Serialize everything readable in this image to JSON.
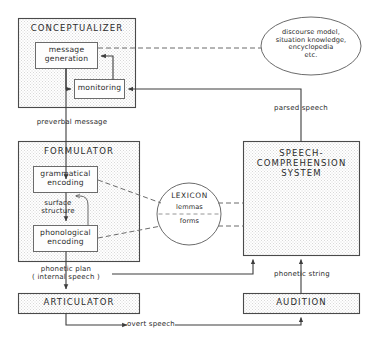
{
  "diagram": {
    "colors": {
      "stroke": "#4a4a4a",
      "inner_stroke": "#6b6b6b",
      "module_fill": "#f2f2f2",
      "inner_fill": "#fdfdfd",
      "text": "#2b2b2b",
      "background": "#ffffff"
    },
    "modules": [
      {
        "id": "conceptualizer",
        "label": "CONCEPTUALIZER"
      },
      {
        "id": "formulator",
        "label": "FORMULATOR"
      },
      {
        "id": "speech-comprehension-system",
        "label": "SPEECH-\nCOMPREHENSION\nSYSTEM"
      },
      {
        "id": "articulator",
        "label": "ARTICULATOR"
      },
      {
        "id": "audition",
        "label": "AUDITION"
      }
    ],
    "sub_processes": [
      {
        "id": "message-generation",
        "label": "message\ngeneration"
      },
      {
        "id": "monitoring",
        "label": "monitoring"
      },
      {
        "id": "grammatical-encoding",
        "label": "grammatical\nencoding"
      },
      {
        "id": "phonological-encoding",
        "label": "phonological\nencoding"
      }
    ],
    "knowledge_stores": [
      {
        "id": "discourse-knowledge",
        "label": "discourse model,\nsituation knowledge,\nencyclopedia\netc."
      },
      {
        "id": "lexicon",
        "title": "LEXICON",
        "upper": "lemmas",
        "lower": "forms"
      }
    ],
    "edge_labels": [
      {
        "id": "preverbal-message",
        "label": "preverbal message"
      },
      {
        "id": "surface-structure",
        "label": "surface\nstructure"
      },
      {
        "id": "phonetic-plan",
        "label": "phonetic plan\n( internal speech )"
      },
      {
        "id": "parsed-speech",
        "label": "parsed speech"
      },
      {
        "id": "phonetic-string",
        "label": "phonetic string"
      },
      {
        "id": "overt-speech",
        "label": "overt speech"
      }
    ]
  }
}
